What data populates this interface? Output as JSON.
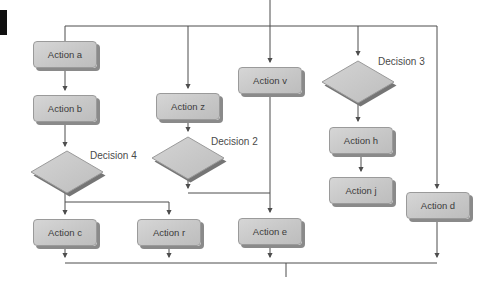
{
  "figure": {
    "type": "flowchart",
    "background": "#ffffff",
    "line_color": "#4d4d4d",
    "shape_fill": "#c9c9c9",
    "shape_border": "#9a9a9a",
    "shape_shadow": "#8a8a8a",
    "text_color": "#3b3b3b",
    "edge_tab_color": "#101010"
  },
  "nodes": {
    "a": {
      "label": "Action a",
      "type": "action"
    },
    "b": {
      "label": "Action b",
      "type": "action"
    },
    "c": {
      "label": "Action c",
      "type": "action"
    },
    "z": {
      "label": "Action z",
      "type": "action"
    },
    "r": {
      "label": "Action r",
      "type": "action"
    },
    "v": {
      "label": "Action v",
      "type": "action"
    },
    "e": {
      "label": "Action e",
      "type": "action"
    },
    "h": {
      "label": "Action h",
      "type": "action"
    },
    "j": {
      "label": "Action j",
      "type": "action"
    },
    "d": {
      "label": "Action d",
      "type": "action"
    },
    "d2": {
      "label": "Decision 2",
      "type": "decision"
    },
    "d3": {
      "label": "Decision 3",
      "type": "decision"
    },
    "d4": {
      "label": "Decision 4",
      "type": "decision"
    }
  },
  "edges": [
    {
      "from": "entry",
      "to": "parallel-rail"
    },
    {
      "from": "parallel-rail",
      "to": "Action a"
    },
    {
      "from": "parallel-rail",
      "to": "Action z"
    },
    {
      "from": "parallel-rail",
      "to": "Action v"
    },
    {
      "from": "parallel-rail",
      "to": "Decision 3"
    },
    {
      "from": "parallel-rail",
      "to": "Action d"
    },
    {
      "from": "Action a",
      "to": "Action b"
    },
    {
      "from": "Action b",
      "to": "Decision 4"
    },
    {
      "from": "Decision 4",
      "to": "Action c"
    },
    {
      "from": "Decision 4",
      "to": "Action r"
    },
    {
      "from": "Action z",
      "to": "Decision 2"
    },
    {
      "from": "Decision 2",
      "to": "Action e"
    },
    {
      "from": "Action v",
      "to": "Action e"
    },
    {
      "from": "Decision 3",
      "to": "Action h"
    },
    {
      "from": "Action h",
      "to": "Action j"
    },
    {
      "from": "Action c",
      "to": "join-rail"
    },
    {
      "from": "Action r",
      "to": "join-rail"
    },
    {
      "from": "Action e",
      "to": "join-rail"
    },
    {
      "from": "Action d",
      "to": "join-rail"
    },
    {
      "from": "join-rail",
      "to": "exit"
    }
  ]
}
